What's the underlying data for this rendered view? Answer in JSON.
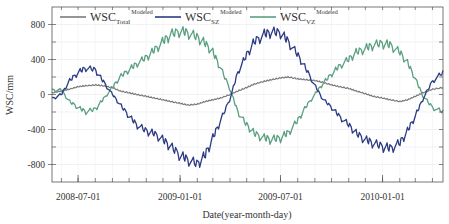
{
  "chart_data": {
    "type": "line",
    "title": "",
    "xlabel": "Date(year-month-day)",
    "ylabel": "WSC/mm",
    "ylim": [
      -1000,
      1000
    ],
    "yticks": [
      -800,
      -400,
      0,
      400,
      800
    ],
    "ytick_labels": [
      "-800",
      "-400",
      "0",
      "400",
      "800"
    ],
    "xlim": [
      "2008-05-15",
      "2010-04-20"
    ],
    "xticks": [
      "2008-07-01",
      "2009-01-01",
      "2009-07-01",
      "2010-01-01"
    ],
    "xtick_labels": [
      "2008-07-01",
      "2009-01-01",
      "2009-07-01",
      "2010-01-01"
    ],
    "grid": true,
    "legend_position": "top-left-inside",
    "x": [
      "2008-05-15",
      "2008-06-01",
      "2008-06-15",
      "2008-07-01",
      "2008-07-15",
      "2008-08-01",
      "2008-08-15",
      "2008-09-01",
      "2008-09-15",
      "2008-10-01",
      "2008-10-15",
      "2008-11-01",
      "2008-11-15",
      "2008-12-01",
      "2008-12-15",
      "2009-01-01",
      "2009-01-15",
      "2009-02-01",
      "2009-02-15",
      "2009-03-01",
      "2009-03-15",
      "2009-04-01",
      "2009-04-15",
      "2009-05-01",
      "2009-05-15",
      "2009-06-01",
      "2009-06-15",
      "2009-07-01",
      "2009-07-15",
      "2009-08-01",
      "2009-08-15",
      "2009-09-01",
      "2009-09-15",
      "2009-10-01",
      "2009-10-15",
      "2009-11-01",
      "2009-11-15",
      "2009-12-01",
      "2009-12-15",
      "2010-01-01",
      "2010-01-15",
      "2010-02-01",
      "2010-02-15",
      "2010-03-01",
      "2010-03-15",
      "2010-04-01",
      "2010-04-20"
    ],
    "series": [
      {
        "name": "WSC_Total^Modeled",
        "color": "#7a7a7a",
        "values": [
          20,
          40,
          60,
          90,
          100,
          110,
          100,
          80,
          40,
          20,
          0,
          -20,
          -40,
          -60,
          -80,
          -100,
          -120,
          -110,
          -80,
          -60,
          -40,
          0,
          40,
          80,
          120,
          150,
          170,
          190,
          200,
          180,
          170,
          160,
          140,
          110,
          90,
          70,
          40,
          10,
          -20,
          -40,
          -60,
          -80,
          -60,
          -20,
          20,
          60,
          80
        ]
      },
      {
        "name": "WSC_SZ^Modeled",
        "color": "#2b3b82",
        "values": [
          -50,
          0,
          150,
          250,
          300,
          280,
          150,
          0,
          -120,
          -250,
          -350,
          -420,
          -450,
          -520,
          -600,
          -700,
          -750,
          -800,
          -700,
          -500,
          -300,
          -50,
          250,
          450,
          600,
          680,
          710,
          700,
          600,
          450,
          300,
          100,
          -50,
          -150,
          -250,
          -350,
          -450,
          -520,
          -560,
          -600,
          -620,
          -560,
          -420,
          -250,
          -50,
          150,
          250
        ]
      },
      {
        "name": "WSC_VZ^Modeled",
        "color": "#5aa080",
        "values": [
          50,
          50,
          -80,
          -150,
          -200,
          -170,
          -60,
          80,
          200,
          280,
          350,
          420,
          500,
          600,
          680,
          720,
          700,
          650,
          580,
          480,
          300,
          60,
          -200,
          -350,
          -450,
          -500,
          -520,
          -500,
          -440,
          -300,
          -150,
          0,
          120,
          230,
          320,
          400,
          480,
          520,
          560,
          580,
          560,
          480,
          360,
          180,
          -20,
          -150,
          -200
        ]
      }
    ]
  },
  "legend": {
    "items": [
      {
        "base": "WSC",
        "sub": "Total",
        "sup": "Modeled",
        "color": "#7a7a7a"
      },
      {
        "base": "WSC",
        "sub": "SZ",
        "sup": "Modeled",
        "color": "#2b3b82"
      },
      {
        "base": "WSC",
        "sub": "VZ",
        "sup": "Modeled",
        "color": "#5aa080"
      }
    ]
  },
  "axes": {
    "xlabel": "Date(year-month-day)",
    "ylabel": "WSC/mm"
  }
}
